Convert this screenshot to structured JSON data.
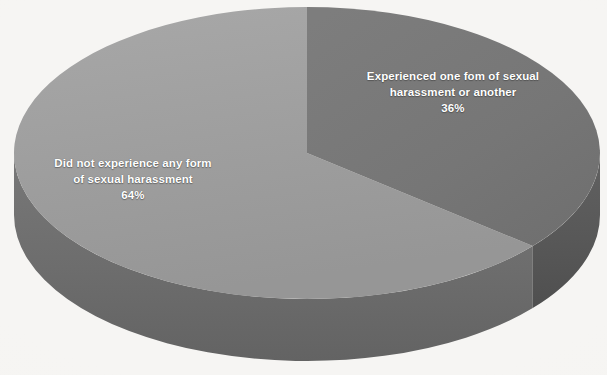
{
  "figure": {
    "background_color": "#f6f5f3",
    "label_text_color": "#ffffff"
  },
  "chart_data": {
    "type": "pie",
    "title": "",
    "subtitle": "",
    "xlabel": "",
    "ylabel": "",
    "legend_position": "none",
    "grid": false,
    "style": "3d-pie",
    "start_angle_deg": 0,
    "direction": "clockwise",
    "categories": [
      "Experienced one fom of sexual harassment or another",
      "Did not experience any form of sexual harassment"
    ],
    "values": [
      36,
      64
    ],
    "value_unit": "%",
    "labels": [
      {
        "name": "experienced",
        "line1": "Experienced one fom of sexual",
        "line2": "harassment or another",
        "percent": "36%",
        "value": 36,
        "color": "#767676",
        "sweep_deg": 129.6
      },
      {
        "name": "not-experienced",
        "line1": "Did not experience any form",
        "line2": "of sexual harassment",
        "percent": "64%",
        "value": 64,
        "color": "#9e9e9e",
        "sweep_deg": 230.4
      }
    ],
    "colors": [
      "#767676",
      "#9e9e9e"
    ],
    "side_wall_colors": [
      "#555555",
      "#6e6e6e"
    ]
  },
  "geometry": {
    "center_x": 307,
    "center_y": 153,
    "radius_x": 293,
    "radius_y": 146,
    "depth": 62
  }
}
